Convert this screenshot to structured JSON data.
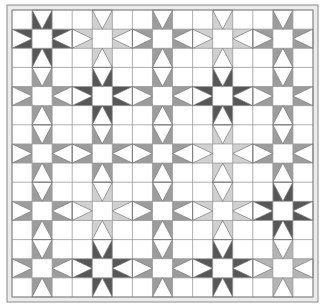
{
  "quilt": {
    "title": "Star quilt pattern",
    "grid": {
      "rows": 15,
      "cols": 15,
      "inner_left": 12,
      "inner_top": 10,
      "inner_right": 313,
      "inner_bottom": 297
    },
    "border": {
      "outer_left": 7,
      "outer_top": 5,
      "outer_right": 318,
      "outer_bottom": 302,
      "fill": "#ececec",
      "line_color": "#8a8a8a"
    },
    "colors": {
      "background": "#ffffff",
      "grid_line": "#9a9a9a",
      "diamond_outline": "#7a7a7a",
      "dark": "#575757",
      "medium": "#9c9c9c",
      "medium_light": "#b4b4b4",
      "light": "#d0d0d0"
    },
    "star_center_indices": [
      1,
      4,
      7,
      10,
      13
    ],
    "stars": [
      {
        "row": 1,
        "col": 1,
        "shade": "dark"
      },
      {
        "row": 1,
        "col": 4,
        "shade": "light"
      },
      {
        "row": 1,
        "col": 7,
        "shade": "medium"
      },
      {
        "row": 1,
        "col": 10,
        "shade": "light"
      },
      {
        "row": 1,
        "col": 13,
        "shade": "medium"
      },
      {
        "row": 4,
        "col": 1,
        "shade": "medium"
      },
      {
        "row": 4,
        "col": 4,
        "shade": "dark"
      },
      {
        "row": 4,
        "col": 7,
        "shade": "medium"
      },
      {
        "row": 4,
        "col": 10,
        "shade": "dark"
      },
      {
        "row": 4,
        "col": 13,
        "shade": "medium"
      },
      {
        "row": 7,
        "col": 1,
        "shade": "medium"
      },
      {
        "row": 7,
        "col": 4,
        "shade": "medium"
      },
      {
        "row": 7,
        "col": 7,
        "shade": "medium"
      },
      {
        "row": 7,
        "col": 10,
        "shade": "light"
      },
      {
        "row": 7,
        "col": 13,
        "shade": "medium"
      },
      {
        "row": 10,
        "col": 1,
        "shade": "medium"
      },
      {
        "row": 10,
        "col": 4,
        "shade": "light"
      },
      {
        "row": 10,
        "col": 7,
        "shade": "medium"
      },
      {
        "row": 10,
        "col": 10,
        "shade": "light"
      },
      {
        "row": 10,
        "col": 13,
        "shade": "dark"
      },
      {
        "row": 13,
        "col": 1,
        "shade": "medium"
      },
      {
        "row": 13,
        "col": 4,
        "shade": "dark"
      },
      {
        "row": 13,
        "col": 7,
        "shade": "medium"
      },
      {
        "row": 13,
        "col": 10,
        "shade": "dark"
      },
      {
        "row": 13,
        "col": 13,
        "shade": "medium_light"
      }
    ]
  }
}
